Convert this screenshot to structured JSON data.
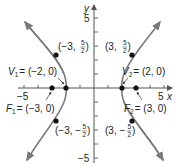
{
  "figure": {
    "type": "hyperbola-graph",
    "equation_implied": "x^2/4 - y^2/5 = 1",
    "axes": {
      "x_label": "x",
      "y_label": "y",
      "x_tick_labels": {
        "neg": "−5",
        "pos": "5"
      },
      "y_tick_labels": {
        "pos": "5",
        "neg": "−5"
      },
      "range": [
        -5,
        5
      ],
      "tick_step": 1
    },
    "points": {
      "v1": {
        "name": "V",
        "sub": "1",
        "coords": "= (−2, 0)",
        "x": -2,
        "y": 0
      },
      "v2": {
        "name": "V",
        "sub": "2",
        "coords": "= (2, 0)",
        "x": 2,
        "y": 0
      },
      "f1": {
        "name": "F",
        "sub": "1",
        "coords": "= (−3, 0)",
        "x": -3,
        "y": 0
      },
      "f2": {
        "name": "F",
        "sub": "2",
        "coords": "= (3, 0)",
        "x": 3,
        "y": 0
      },
      "p_ul": {
        "prefix": "(−3,",
        "num": "5",
        "den": "2",
        "suffix": ")",
        "x": -3,
        "y": 2.5
      },
      "p_ur": {
        "prefix": "(3,",
        "num": "5",
        "den": "2",
        "suffix": ")",
        "x": 3,
        "y": 2.5
      },
      "p_ll": {
        "prefix": "(−3, −",
        "num": "5",
        "den": "2",
        "suffix": ")",
        "x": -3,
        "y": -2.5
      },
      "p_lr": {
        "prefix": "(3, −",
        "num": "5",
        "den": "2",
        "suffix": ")",
        "x": 3,
        "y": -2.5
      }
    },
    "colors": {
      "curve": "#7a7a7a",
      "axis": "#555555",
      "point": "#111111",
      "text": "#222222"
    }
  }
}
